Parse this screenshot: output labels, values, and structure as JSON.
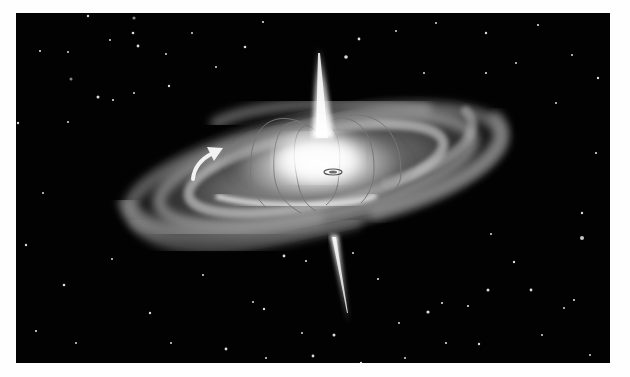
{
  "figure": {
    "background_color": "#020202",
    "disk_color": "#e8e8e8",
    "jet_color": "#f4f4f4",
    "elements": {
      "disk": "spiral-galaxy-disk",
      "core": "bright-core",
      "field_lines": "magnetic-field-loops",
      "jet_top": "upper-polar-jet",
      "jet_bottom": "lower-polar-jet",
      "rotation_arrow": "rotation-direction-arrow",
      "stars": "starfield"
    }
  },
  "caption": {
    "visible_text": "",
    "note": "caption line cut off at bottom edge; only ascender tips visible"
  }
}
